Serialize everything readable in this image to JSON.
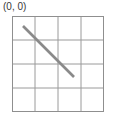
{
  "figure": {
    "origin_label": "(0, 0)",
    "background_color": "#ffffff"
  },
  "grid": {
    "columns": 4,
    "rows": 4,
    "line_color": "#9a9a9a",
    "border_color": "#8f8f8f",
    "line_width": 1,
    "origin_x": 0,
    "origin_y": 0,
    "width": 92,
    "height": 96,
    "cell_width": 23,
    "cell_height": 24
  },
  "segment": {
    "name": "diagonal-line",
    "color": "#8a8a8a",
    "stroke_width": 2.6,
    "x1": 11,
    "y1": 10,
    "x2": 62,
    "y2": 61,
    "start_cell": "(0, 0)",
    "end_cell": "(2, 2)",
    "direction": "down-right",
    "slope": 1
  },
  "chart_data": {
    "type": "line",
    "title": "",
    "xlabel": "",
    "ylabel": "",
    "xlim": [
      0,
      4
    ],
    "ylim": [
      0,
      4
    ],
    "grid": true,
    "legend": null,
    "annotations": [
      {
        "text": "(0, 0)",
        "position": "top-left-outside"
      }
    ],
    "series": [
      {
        "name": "diagonal",
        "x": [
          0.48,
          2.7
        ],
        "y": [
          0.42,
          2.54
        ],
        "color": "#8a8a8a"
      }
    ]
  }
}
